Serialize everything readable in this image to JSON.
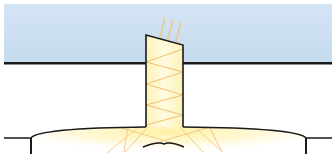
{
  "diagram": {
    "title": "Tubular skylight light path",
    "colors": {
      "sky": "#cfe1f2",
      "roof_line": "#1a1a1a",
      "tube_fill": "#fdf6c4",
      "ray": "#f2c27a",
      "glow": "#fff3b0",
      "outline": "#1a1a1a"
    },
    "elements": [
      {
        "name": "sky-band",
        "label": "Sky / outside"
      },
      {
        "name": "roof-line",
        "label": "Roof"
      },
      {
        "name": "light-tube",
        "label": "Reflective light tube"
      },
      {
        "name": "incoming-rays",
        "label": "Sunlight"
      },
      {
        "name": "ceiling",
        "label": "Room ceiling"
      },
      {
        "name": "diffuser",
        "label": "Diffuser"
      },
      {
        "name": "light-spread",
        "label": "Diffused light in room"
      }
    ]
  }
}
